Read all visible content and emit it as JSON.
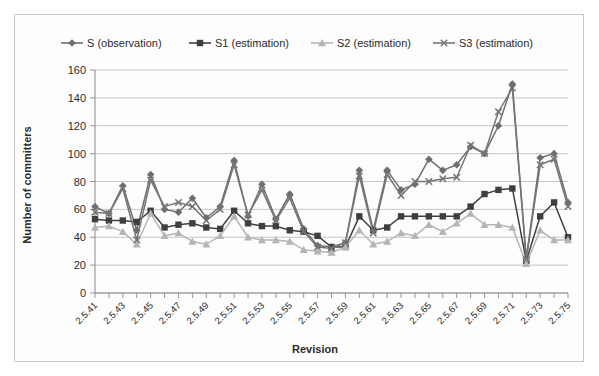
{
  "chart_data": {
    "type": "line",
    "title": "",
    "xlabel": "Revision",
    "ylabel": "Number of committers",
    "ylim": [
      0,
      160
    ],
    "yticks": [
      0,
      20,
      40,
      60,
      80,
      100,
      120,
      140,
      160
    ],
    "grid": true,
    "legend_position": "top",
    "x_tick_label_rotation": -45,
    "x_tick_label_interval": 2,
    "categories": [
      "2.5.41",
      "2.5.42",
      "2.5.43",
      "2.5.44",
      "2.5.45",
      "2.5.46",
      "2.5.47",
      "2.5.48",
      "2.5.49",
      "2.5.50",
      "2.5.51",
      "2.5.52",
      "2.5.53",
      "2.5.54",
      "2.5.55",
      "2.5.56",
      "2.5.57",
      "2.5.58",
      "2.5.59",
      "2.5.60",
      "2.5.61",
      "2.5.62",
      "2.5.63",
      "2.5.64",
      "2.5.65",
      "2.5.66",
      "2.5.67",
      "2.5.68",
      "2.5.69",
      "2.5.70",
      "2.5.71",
      "2.5.72",
      "2.5.73",
      "2.5.74",
      "2.5.75"
    ],
    "series": [
      {
        "name": "S (observation)",
        "marker": "diamond",
        "color": "#6e6e6e",
        "values": [
          62,
          57,
          77,
          45,
          85,
          60,
          58,
          68,
          54,
          62,
          95,
          55,
          78,
          53,
          71,
          46,
          34,
          33,
          36,
          88,
          45,
          88,
          74,
          78,
          96,
          88,
          92,
          105,
          100,
          120,
          150,
          25,
          97,
          100,
          65
        ]
      },
      {
        "name": "S1 (estimation)",
        "marker": "square",
        "color": "#3f3f3f",
        "values": [
          53,
          52,
          52,
          51,
          59,
          47,
          49,
          50,
          47,
          46,
          59,
          50,
          48,
          48,
          45,
          44,
          41,
          33,
          33,
          55,
          45,
          47,
          55,
          55,
          55,
          55,
          55,
          62,
          71,
          74,
          75,
          23,
          55,
          65,
          40
        ]
      },
      {
        "name": "S2 (estimation)",
        "marker": "triangle",
        "color": "#b5b5b5",
        "values": [
          47,
          48,
          44,
          35,
          57,
          41,
          43,
          37,
          35,
          41,
          55,
          40,
          38,
          38,
          37,
          31,
          30,
          29,
          33,
          45,
          35,
          37,
          43,
          41,
          49,
          44,
          50,
          57,
          49,
          49,
          47,
          21,
          45,
          38,
          38
        ]
      },
      {
        "name": "S3 (estimation)",
        "marker": "cross",
        "color": "#757575",
        "values": [
          58,
          57,
          75,
          38,
          81,
          62,
          65,
          62,
          52,
          60,
          92,
          56,
          74,
          52,
          68,
          44,
          33,
          32,
          36,
          84,
          43,
          85,
          70,
          80,
          80,
          82,
          83,
          106,
          100,
          130,
          147,
          24,
          92,
          96,
          62
        ]
      }
    ]
  }
}
